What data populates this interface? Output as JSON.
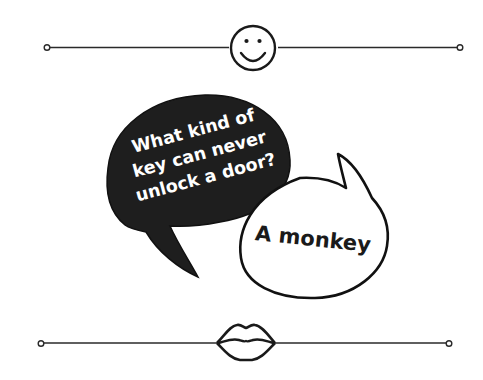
{
  "joke": {
    "question_lines": [
      "What kind of",
      "key can never",
      "unlock a door?"
    ],
    "answer": "A monkey"
  },
  "decor": {
    "top_icon": "smiley-face-icon",
    "bottom_icon": "lips-icon",
    "stroke_color": "#1a1a1a",
    "question_bubble_fill": "#1e1e1e",
    "answer_bubble_fill": "#ffffff"
  }
}
